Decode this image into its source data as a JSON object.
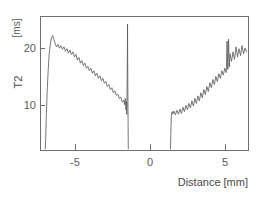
{
  "chart_data": {
    "type": "line",
    "title": "",
    "xlabel": "Distance",
    "xunit": "[mm]",
    "xlabel_full": "Distance [mm]",
    "ylabel": "T2",
    "yunit": "[ms]",
    "xlim": [
      -7.2,
      6.7
    ],
    "ylim": [
      4.2,
      25.5
    ],
    "xticks": [
      -5,
      0,
      5
    ],
    "xticklabels": [
      "-5",
      "0",
      "5"
    ],
    "yticks": [
      10,
      20
    ],
    "yticklabels": [
      "10",
      "20"
    ],
    "grid": false,
    "legend": "none",
    "series": [
      {
        "name": "left-branch",
        "comment": "T2 profile left of center gap; rises steeply from baseline then decays with noise",
        "x": [
          -6.85,
          -6.82,
          -6.78,
          -6.72,
          -6.65,
          -6.58,
          -6.5,
          -6.42,
          -6.35,
          -6.28,
          -6.2,
          -6.1,
          -6.0,
          -5.9,
          -5.8,
          -5.7,
          -5.6,
          -5.5,
          -5.4,
          -5.3,
          -5.2,
          -5.1,
          -5.0,
          -4.9,
          -4.8,
          -4.7,
          -4.6,
          -4.5,
          -4.4,
          -4.3,
          -4.2,
          -4.1,
          -4.0,
          -3.9,
          -3.8,
          -3.7,
          -3.6,
          -3.5,
          -3.4,
          -3.3,
          -3.2,
          -3.1,
          -3.0,
          -2.9,
          -2.8,
          -2.7,
          -2.6,
          -2.5,
          -2.4,
          -2.3,
          -2.2,
          -2.1,
          -2.0,
          -1.9,
          -1.8,
          -1.7,
          -1.6,
          -1.55,
          -1.5,
          -1.45,
          -1.42,
          -1.4
        ],
        "y": [
          4.4,
          6.0,
          9.5,
          13.5,
          17.0,
          19.6,
          21.2,
          22.1,
          22.4,
          21.8,
          21.2,
          20.6,
          21.0,
          20.4,
          20.8,
          20.2,
          20.6,
          19.9,
          20.3,
          19.6,
          20.1,
          19.4,
          19.8,
          19.0,
          19.4,
          18.5,
          18.9,
          18.0,
          18.4,
          17.6,
          18.0,
          17.2,
          17.5,
          16.8,
          17.2,
          16.4,
          16.8,
          16.0,
          16.4,
          15.6,
          16.0,
          15.2,
          15.6,
          14.8,
          15.1,
          14.3,
          14.6,
          13.8,
          14.1,
          13.3,
          13.6,
          12.9,
          13.1,
          12.4,
          12.6,
          11.8,
          12.1,
          11.4,
          12.4,
          10.6,
          11.9,
          9.9
        ]
      },
      {
        "name": "center-spike",
        "comment": "Narrow vertical spike at the inner edge of the left branch near x = -1.35 mm",
        "x": [
          -1.4,
          -1.38,
          -1.36,
          -1.35,
          -1.34,
          -1.32,
          -1.3
        ],
        "y": [
          9.9,
          14.0,
          19.5,
          24.2,
          18.0,
          11.0,
          4.4
        ]
      },
      {
        "name": "right-branch",
        "comment": "T2 profile right of center gap; rises with noise toward the right edge",
        "x": [
          1.52,
          1.54,
          1.56,
          1.58,
          1.62,
          1.68,
          1.75,
          1.85,
          1.95,
          2.05,
          2.15,
          2.25,
          2.35,
          2.45,
          2.55,
          2.65,
          2.75,
          2.85,
          2.95,
          3.05,
          3.15,
          3.25,
          3.35,
          3.45,
          3.55,
          3.65,
          3.75,
          3.85,
          3.95,
          4.05,
          4.15,
          4.25,
          4.35,
          4.45,
          4.55,
          4.65,
          4.75,
          4.85,
          4.95,
          5.05,
          5.15,
          5.25,
          5.3,
          5.35,
          5.4,
          5.45,
          5.5,
          5.6,
          5.7,
          5.8,
          5.9,
          6.0,
          6.1,
          6.2,
          6.3,
          6.4,
          6.5,
          6.6
        ],
        "y": [
          4.4,
          6.5,
          8.5,
          9.8,
          10.3,
          9.9,
          10.4,
          9.8,
          10.5,
          9.9,
          10.7,
          10.0,
          11.0,
          10.3,
          11.3,
          10.6,
          11.6,
          10.9,
          12.0,
          11.2,
          12.4,
          11.6,
          12.8,
          12.0,
          13.3,
          12.5,
          13.8,
          13.0,
          14.3,
          13.5,
          14.9,
          14.1,
          15.4,
          14.6,
          15.9,
          15.1,
          16.3,
          15.6,
          16.8,
          16.1,
          17.2,
          16.5,
          21.5,
          17.0,
          21.8,
          17.4,
          19.5,
          18.3,
          19.8,
          18.6,
          20.6,
          19.0,
          20.3,
          19.2,
          20.8,
          19.5,
          20.4,
          19.8
        ]
      }
    ]
  },
  "colors": {
    "curve": "#555555",
    "axis": "#6f6f6f",
    "text": "#4a4a4a",
    "background": "#ffffff"
  }
}
